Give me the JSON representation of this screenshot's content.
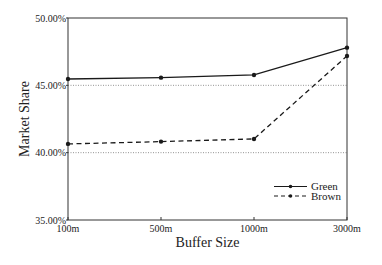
{
  "chart_data": {
    "type": "line",
    "title": "",
    "xlabel": "Buffer Size",
    "ylabel": "Market Share",
    "categories": [
      "100m",
      "500m",
      "1000m",
      "3000m"
    ],
    "ylim": [
      35,
      50
    ],
    "yticks": [
      35,
      40,
      45,
      50
    ],
    "ytick_labels": [
      "35.00%",
      "40.00%",
      "45.00%",
      "50.00%"
    ],
    "gridlines": [
      40,
      45
    ],
    "grid_style": "dotted",
    "legend_position": "bottom-right",
    "series": [
      {
        "name": "Green",
        "values": [
          45.47,
          45.57,
          45.77,
          47.8
        ],
        "line_style": "solid",
        "color": "#1a1a1a"
      },
      {
        "name": "Brown",
        "values": [
          40.65,
          40.82,
          41.02,
          47.18
        ],
        "line_style": "dashed",
        "color": "#1a1a1a"
      }
    ]
  }
}
